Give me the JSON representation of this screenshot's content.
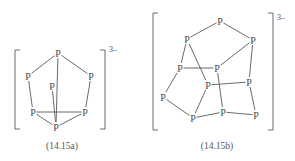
{
  "structures": [
    {
      "id": "14.15a",
      "caption": "(14.15a)",
      "charge": "3–",
      "caption_pos": [
        62,
        149
      ],
      "charge_pos": [
        109,
        52
      ],
      "brackets": {
        "left_x": 15,
        "right_x": 105,
        "top_y": 50,
        "bottom_y": 129,
        "tick": 5
      },
      "atoms": [
        {
          "label": "P",
          "x": 58,
          "y": 53
        },
        {
          "label": "P",
          "x": 28,
          "y": 76
        },
        {
          "label": "P",
          "x": 91,
          "y": 76
        },
        {
          "label": "P",
          "x": 52,
          "y": 86
        },
        {
          "label": "P",
          "x": 33,
          "y": 112
        },
        {
          "label": "P",
          "x": 85,
          "y": 112
        },
        {
          "label": "P",
          "x": 56,
          "y": 127
        }
      ],
      "bonds": [
        [
          0,
          1
        ],
        [
          0,
          2
        ],
        [
          0,
          6
        ],
        [
          1,
          4
        ],
        [
          2,
          5
        ],
        [
          4,
          5
        ],
        [
          4,
          6
        ],
        [
          5,
          6
        ],
        [
          3,
          6
        ]
      ]
    },
    {
      "id": "14.15b",
      "caption": "(14.15b)",
      "charge": "3–",
      "caption_pos": [
        217,
        149
      ],
      "charge_pos": [
        277,
        20
      ],
      "brackets": {
        "left_x": 153,
        "right_x": 273,
        "top_y": 13,
        "bottom_y": 130,
        "tick": 5
      },
      "atoms": [
        {
          "label": "P",
          "x": 220,
          "y": 21
        },
        {
          "label": "P",
          "x": 187,
          "y": 39
        },
        {
          "label": "P",
          "x": 253,
          "y": 40
        },
        {
          "label": "P",
          "x": 180,
          "y": 68
        },
        {
          "label": "P",
          "x": 217,
          "y": 68
        },
        {
          "label": "P",
          "x": 208,
          "y": 85
        },
        {
          "label": "P",
          "x": 249,
          "y": 82
        },
        {
          "label": "P",
          "x": 163,
          "y": 97
        },
        {
          "label": "P",
          "x": 193,
          "y": 118
        },
        {
          "label": "P",
          "x": 223,
          "y": 112
        },
        {
          "label": "P",
          "x": 256,
          "y": 115
        }
      ],
      "bonds": [
        [
          0,
          1
        ],
        [
          0,
          2
        ],
        [
          1,
          3
        ],
        [
          1,
          5
        ],
        [
          3,
          4
        ],
        [
          2,
          4
        ],
        [
          2,
          6
        ],
        [
          3,
          7
        ],
        [
          4,
          9
        ],
        [
          5,
          6
        ],
        [
          5,
          8
        ],
        [
          7,
          8
        ],
        [
          8,
          9
        ],
        [
          6,
          10
        ],
        [
          9,
          10
        ]
      ]
    }
  ]
}
